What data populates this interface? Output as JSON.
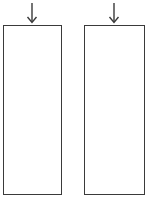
{
  "diagram": {
    "elements": [
      {
        "type": "arrow",
        "direction": "down",
        "icon": "arrow-down-icon"
      },
      {
        "type": "box",
        "label": ""
      },
      {
        "type": "arrow",
        "direction": "down",
        "icon": "arrow-down-icon"
      },
      {
        "type": "box",
        "label": ""
      }
    ],
    "colors": {
      "stroke": "#3a3a3a",
      "background": "#ffffff"
    }
  }
}
